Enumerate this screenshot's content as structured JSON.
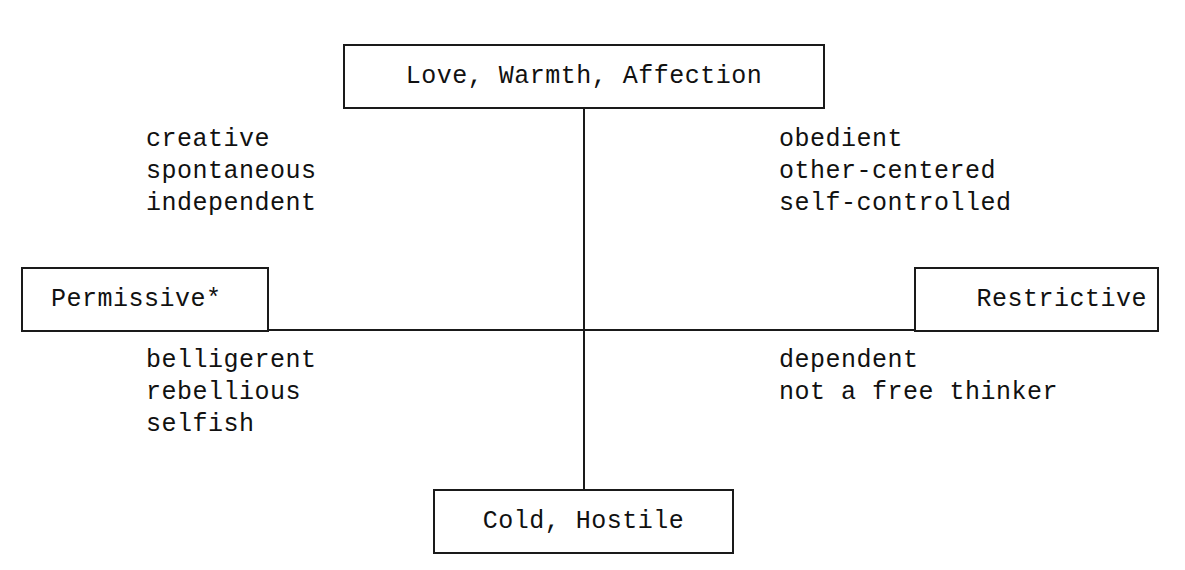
{
  "diagram": {
    "axes": {
      "top": "Love, Warmth, Affection",
      "bottom": "Cold, Hostile",
      "left": "Permissive*",
      "right": "Restrictive"
    },
    "quadrants": {
      "top_left": [
        "creative",
        "spontaneous",
        "independent"
      ],
      "top_right": [
        "obedient",
        "other-centered",
        "self-controlled"
      ],
      "bottom_left": [
        "belligerent",
        "rebellious",
        "selfish"
      ],
      "bottom_right": [
        "dependent",
        "not a free thinker"
      ]
    }
  }
}
